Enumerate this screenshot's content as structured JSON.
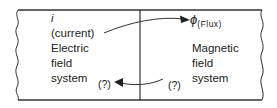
{
  "diagram": {
    "left_system": {
      "symbol": "i",
      "symbol_note": "(current)",
      "lines": [
        "Electric",
        "field",
        "system"
      ],
      "unknown_label": "(?)"
    },
    "right_system": {
      "symbol": "ϕ",
      "symbol_note": "(Flux)",
      "lines": [
        "Magnetic",
        "field",
        "system"
      ],
      "unknown_label": "(?)"
    },
    "arrows": [
      {
        "from": "left_system.symbol_note",
        "to": "right_system.symbol",
        "direction": "left-to-right"
      },
      {
        "from": "right_system.unknown_label",
        "to": "left_system.unknown_label",
        "direction": "right-to-left"
      }
    ],
    "colors": {
      "line": "#333333",
      "text": "#222222",
      "background": "#ffffff"
    }
  }
}
